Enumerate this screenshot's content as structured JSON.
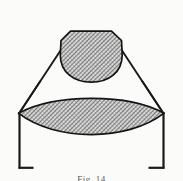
{
  "figure": {
    "caption": "Fig. 14",
    "background_color": "#fbfbfa",
    "line_color": "#1a1a1a",
    "hatch_color": "#3c3c3c",
    "hatch_fill_color": "#d8d8d8",
    "parts": {
      "upper_dome_label": "upper-hatched-dome",
      "lower_lens_label": "lower-hatched-lens",
      "left_strut_label": "left-diagonal-strut",
      "right_strut_label": "right-diagonal-strut",
      "left_leg_label": "left-vertical-leg",
      "right_leg_label": "right-vertical-leg",
      "left_foot_label": "left-foot-bracket",
      "right_foot_label": "right-foot-bracket"
    },
    "geometry": {
      "upper_dome": {
        "top_flat_y": 31,
        "top_flat_x1": 70,
        "top_flat_x2": 112,
        "left_x": 60,
        "right_x": 122,
        "bottom_y": 82,
        "shoulder_y": 38
      },
      "lower_lens": {
        "left_tip_x": 18,
        "right_tip_x": 164,
        "tip_y": 113,
        "top_apex_y": 96,
        "bottom_apex_y": 141
      },
      "left_leg": {
        "x": 19,
        "top_y": 113,
        "bottom_y": 168
      },
      "right_leg": {
        "x": 163,
        "top_y": 113,
        "bottom_y": 168
      },
      "left_foot": {
        "x1": 19,
        "x2": 33,
        "y": 168
      },
      "right_foot": {
        "x1": 149,
        "x2": 163,
        "y": 168
      },
      "left_strut": {
        "x1": 19,
        "y1": 113,
        "x2": 61,
        "y2": 49
      },
      "right_strut": {
        "x1": 163,
        "y1": 113,
        "x2": 121,
        "y2": 49
      }
    }
  }
}
